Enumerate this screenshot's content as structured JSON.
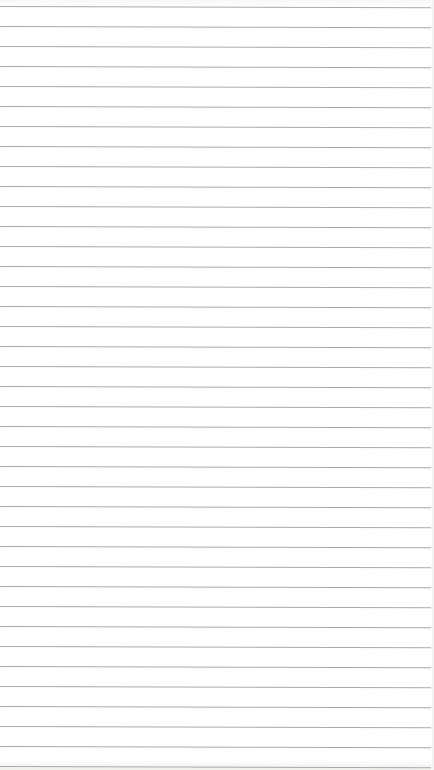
{
  "page": {
    "type": "lined-notepad",
    "background_color": "#ffffff",
    "line_color": "#a9a9a9",
    "line_spacing_px": 20,
    "first_line_y_px": 6,
    "line_count": 39
  }
}
